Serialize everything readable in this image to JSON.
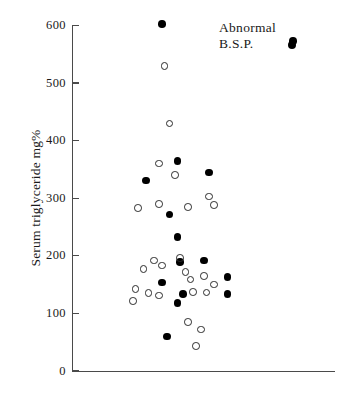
{
  "figure": {
    "background_color": "#ffffff",
    "axis_color": "#4a4a4a",
    "filled_marker_color": "#000000",
    "open_marker_color": "#2b2b2b"
  },
  "annotation": {
    "text": "Abnormal\nB.S.P.",
    "marker": "filled-circle"
  },
  "chart_data": {
    "type": "scatter",
    "title": "",
    "xlabel": "",
    "ylabel": "Serum triglyceride mg%",
    "ylim": [
      0,
      600
    ],
    "yticks": [
      0,
      100,
      200,
      300,
      400,
      500,
      600
    ],
    "ytick_labels": [
      "0",
      "100",
      "200",
      "300",
      "400",
      "500",
      "600"
    ],
    "xlim": [
      0,
      100
    ],
    "xticks": [],
    "xtick_labels": [],
    "grid": false,
    "legend": {
      "position": "top-right",
      "entries": [
        {
          "label": "Abnormal B.S.P.",
          "marker": "filled-circle",
          "color": "#000000"
        }
      ]
    },
    "annotations": [
      {
        "text": "Abnormal B.S.P.",
        "x": 64,
        "y": 580
      }
    ],
    "series": [
      {
        "name": "Abnormal B.S.P.",
        "marker": "filled-circle",
        "color": "#000000",
        "points": [
          {
            "x": 34,
            "y": 603
          },
          {
            "x": 84,
            "y": 573
          },
          {
            "x": 40,
            "y": 365
          },
          {
            "x": 52,
            "y": 345
          },
          {
            "x": 28,
            "y": 331
          },
          {
            "x": 37,
            "y": 272
          },
          {
            "x": 40,
            "y": 233
          },
          {
            "x": 50,
            "y": 192
          },
          {
            "x": 41,
            "y": 189
          },
          {
            "x": 59,
            "y": 163
          },
          {
            "x": 34,
            "y": 154
          },
          {
            "x": 42,
            "y": 134
          },
          {
            "x": 59,
            "y": 134
          },
          {
            "x": 40,
            "y": 118
          },
          {
            "x": 36,
            "y": 60
          }
        ]
      },
      {
        "name": "Normal B.S.P.",
        "marker": "open-circle",
        "color": "#2b2b2b",
        "points": [
          {
            "x": 35,
            "y": 530
          },
          {
            "x": 37,
            "y": 430
          },
          {
            "x": 33,
            "y": 360
          },
          {
            "x": 39,
            "y": 340
          },
          {
            "x": 52,
            "y": 303
          },
          {
            "x": 54,
            "y": 288
          },
          {
            "x": 44,
            "y": 285
          },
          {
            "x": 25,
            "y": 283
          },
          {
            "x": 33,
            "y": 290
          },
          {
            "x": 41,
            "y": 196
          },
          {
            "x": 31,
            "y": 192
          },
          {
            "x": 34,
            "y": 183
          },
          {
            "x": 27,
            "y": 177
          },
          {
            "x": 43,
            "y": 172
          },
          {
            "x": 50,
            "y": 165
          },
          {
            "x": 45,
            "y": 159
          },
          {
            "x": 54,
            "y": 150
          },
          {
            "x": 24,
            "y": 142
          },
          {
            "x": 46,
            "y": 137
          },
          {
            "x": 51,
            "y": 136
          },
          {
            "x": 29,
            "y": 135
          },
          {
            "x": 33,
            "y": 131
          },
          {
            "x": 23,
            "y": 122
          },
          {
            "x": 44,
            "y": 85
          },
          {
            "x": 49,
            "y": 72
          },
          {
            "x": 47,
            "y": 43
          }
        ]
      }
    ]
  }
}
